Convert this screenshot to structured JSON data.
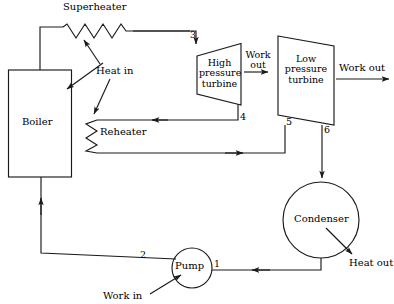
{
  "diagram": {
    "stroke_color": "#1a1a1a",
    "background_color": "#ffffff",
    "components": {
      "boiler": {
        "label": "Boiler"
      },
      "superheater": {
        "label": "Superheater"
      },
      "reheater": {
        "label": "Reheater"
      },
      "high_pressure_turbine": {
        "line1": "High",
        "line2": "pressure",
        "line3": "turbine"
      },
      "low_pressure_turbine": {
        "line1": "Low",
        "line2": "pressure",
        "line3": "turbine"
      },
      "condenser": {
        "label": "Condenser"
      },
      "pump": {
        "label": "Pump"
      }
    },
    "energy_labels": {
      "heat_in": "Heat in",
      "heat_out": "Heat out",
      "work_out_hp_line1": "Work",
      "work_out_hp_line2": "out",
      "work_out_lp": "Work out",
      "work_in": "Work in"
    },
    "state_points": {
      "p1": "1",
      "p2": "2",
      "p3": "3",
      "p4": "4",
      "p5": "5",
      "p6": "6"
    }
  }
}
